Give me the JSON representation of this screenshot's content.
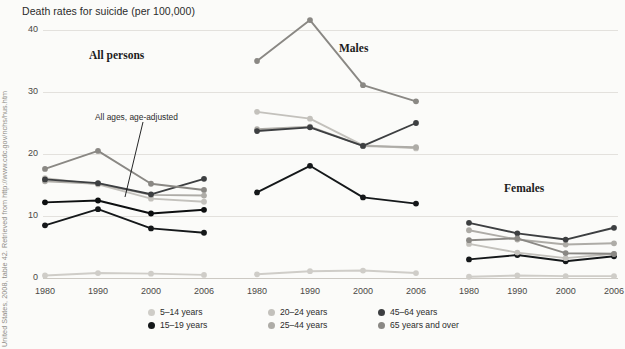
{
  "title": "Death rates for suicide (per 100,000)",
  "source_credit": "United States, 2008, table 42. Retrieved from http://www.cdc.gov/nchs/hus.htm",
  "annotation": "All ages, age-adjusted",
  "colors": {
    "age_5_14": "#cfcdc8",
    "age_15_19": "#15181a",
    "age_20_24": "#c3c1bc",
    "age_25_44": "#aeaca7",
    "age_45_64": "#3d3f41",
    "age_65_plus": "#8a8884",
    "all_ages": "#0d0f10",
    "grid": "#e3e1dd",
    "axis": "#ccc9c3",
    "text": "#2b2b2b"
  },
  "legend": {
    "items": [
      {
        "label": "5–14 years",
        "color_key": "age_5_14",
        "col": 0,
        "row": 0
      },
      {
        "label": "15–19 years",
        "color_key": "age_15_19",
        "col": 0,
        "row": 1
      },
      {
        "label": "20–24 years",
        "color_key": "age_20_24",
        "col": 1,
        "row": 0
      },
      {
        "label": "25–44 years",
        "color_key": "age_25_44",
        "col": 1,
        "row": 1
      },
      {
        "label": "45–64 years",
        "color_key": "age_45_64",
        "col": 2,
        "row": 0
      },
      {
        "label": "65 years and over",
        "color_key": "age_65_plus",
        "col": 2,
        "row": 1
      }
    ]
  },
  "chart_data": {
    "type": "line",
    "title": "Death rates for suicide (per 100,000)",
    "xlabel": "",
    "ylabel": "Death rates for suicide (per 100,000)",
    "x": [
      1980,
      1990,
      2000,
      2006
    ],
    "xticklabels": [
      "1980",
      "1990",
      "2000",
      "2006"
    ],
    "ylim": [
      0,
      40
    ],
    "yticks": [
      0,
      10,
      20,
      30,
      40
    ],
    "yticklabels": [
      "0",
      "10",
      "20",
      "30",
      "40"
    ],
    "grid": true,
    "legend_position": "bottom",
    "panels": [
      {
        "name": "All persons",
        "series": [
          {
            "name": "5–14 years",
            "color_key": "age_5_14",
            "values": [
              0.4,
              0.8,
              0.7,
              0.5
            ]
          },
          {
            "name": "15–19 years",
            "color_key": "age_15_19",
            "values": [
              8.5,
              11.1,
              8.0,
              7.3
            ]
          },
          {
            "name": "20–24 years",
            "color_key": "age_20_24",
            "values": [
              16.1,
              15.1,
              12.8,
              12.3
            ]
          },
          {
            "name": "25–44 years",
            "color_key": "age_25_44",
            "values": [
              15.6,
              15.2,
              13.4,
              13.3
            ]
          },
          {
            "name": "45–64 years",
            "color_key": "age_45_64",
            "values": [
              15.9,
              15.3,
              13.5,
              16.0
            ]
          },
          {
            "name": "65 years and over",
            "color_key": "age_65_plus",
            "values": [
              17.6,
              20.5,
              15.2,
              14.2
            ]
          },
          {
            "name": "All ages, age-adjusted",
            "color_key": "all_ages",
            "values": [
              12.2,
              12.5,
              10.4,
              11.0
            ]
          }
        ]
      },
      {
        "name": "Males",
        "series": [
          {
            "name": "5–14 years",
            "color_key": "age_5_14",
            "values": [
              0.6,
              1.1,
              1.2,
              0.8
            ]
          },
          {
            "name": "15–19 years",
            "color_key": "age_15_19",
            "values": [
              13.8,
              18.1,
              13.0,
              12.0
            ]
          },
          {
            "name": "20–24 years",
            "color_key": "age_20_24",
            "values": [
              26.8,
              25.7,
              21.4,
              20.9
            ]
          },
          {
            "name": "25–44 years",
            "color_key": "age_25_44",
            "values": [
              24.0,
              24.4,
              21.3,
              21.1
            ]
          },
          {
            "name": "45–64 years",
            "color_key": "age_45_64",
            "values": [
              23.7,
              24.3,
              21.3,
              25.0
            ]
          },
          {
            "name": "65 years and over",
            "color_key": "age_65_plus",
            "values": [
              35.0,
              41.6,
              31.1,
              28.5
            ]
          }
        ]
      },
      {
        "name": "Females",
        "series": [
          {
            "name": "5–14 years",
            "color_key": "age_5_14",
            "values": [
              0.2,
              0.4,
              0.3,
              0.3
            ]
          },
          {
            "name": "15–19 years",
            "color_key": "age_15_19",
            "values": [
              3.0,
              3.7,
              2.7,
              3.5
            ]
          },
          {
            "name": "20–24 years",
            "color_key": "age_20_24",
            "values": [
              5.5,
              4.1,
              3.2,
              3.9
            ]
          },
          {
            "name": "25–44 years",
            "color_key": "age_25_44",
            "values": [
              7.7,
              6.2,
              5.4,
              5.6
            ]
          },
          {
            "name": "45–64 years",
            "color_key": "age_45_64",
            "values": [
              8.9,
              7.2,
              6.2,
              8.1
            ]
          },
          {
            "name": "65 years and over",
            "color_key": "age_65_plus",
            "values": [
              6.1,
              6.4,
              4.0,
              3.9
            ]
          }
        ]
      }
    ]
  }
}
